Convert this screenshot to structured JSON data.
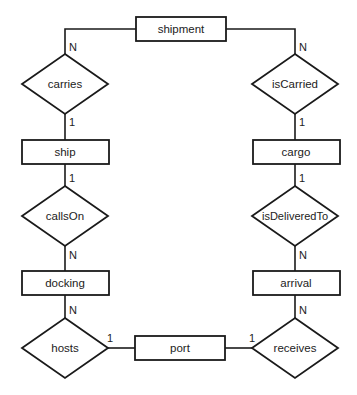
{
  "diagram": {
    "type": "entity-relationship",
    "entities": [
      {
        "id": "shipment",
        "label": "shipment"
      },
      {
        "id": "ship",
        "label": "ship"
      },
      {
        "id": "cargo",
        "label": "cargo"
      },
      {
        "id": "docking",
        "label": "docking"
      },
      {
        "id": "arrival",
        "label": "arrival"
      },
      {
        "id": "port",
        "label": "port"
      }
    ],
    "relationships": [
      {
        "id": "carries",
        "label": "carries"
      },
      {
        "id": "isCarried",
        "label": "isCarried"
      },
      {
        "id": "callsOn",
        "label": "callsOn"
      },
      {
        "id": "isDeliveredTo",
        "label": "isDeliveredTo"
      },
      {
        "id": "hosts",
        "label": "hosts"
      },
      {
        "id": "receives",
        "label": "receives"
      }
    ],
    "connections": [
      {
        "from": "shipment",
        "to": "carries",
        "cardinality": "N"
      },
      {
        "from": "carries",
        "to": "ship",
        "cardinality": "1"
      },
      {
        "from": "shipment",
        "to": "isCarried",
        "cardinality": "N"
      },
      {
        "from": "isCarried",
        "to": "cargo",
        "cardinality": "1"
      },
      {
        "from": "ship",
        "to": "callsOn",
        "cardinality": "1"
      },
      {
        "from": "callsOn",
        "to": "docking",
        "cardinality": "N"
      },
      {
        "from": "cargo",
        "to": "isDeliveredTo",
        "cardinality": "1"
      },
      {
        "from": "isDeliveredTo",
        "to": "arrival",
        "cardinality": "N"
      },
      {
        "from": "docking",
        "to": "hosts",
        "cardinality": "N"
      },
      {
        "from": "hosts",
        "to": "port",
        "cardinality": "1"
      },
      {
        "from": "arrival",
        "to": "receives",
        "cardinality": "N"
      },
      {
        "from": "receives",
        "to": "port",
        "cardinality": "1"
      }
    ]
  }
}
